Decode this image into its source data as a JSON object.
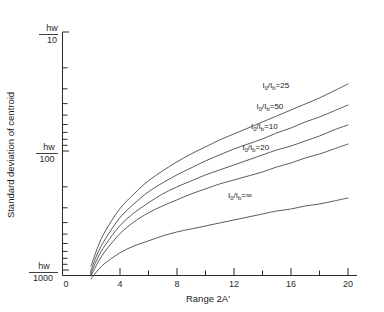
{
  "chart_data": {
    "type": "line",
    "title": "",
    "xlabel": "Range 2A'",
    "ylabel": "Standard deviation of centroid",
    "xlim": [
      0,
      20
    ],
    "xticks": [
      0,
      4,
      8,
      12,
      16,
      20
    ],
    "xtick_labels": [
      "0",
      "4",
      "8",
      "12",
      "16",
      "20"
    ],
    "xminor_ticks": [
      2,
      6,
      10,
      14,
      18
    ],
    "yscale": "log",
    "ylim_labels": [
      "hw/10",
      "hw/100",
      "hw/1000"
    ],
    "yticks": [
      {
        "label_num": "hw",
        "label_den": "10",
        "value": 0.1
      },
      {
        "label_num": "hw",
        "label_den": "100",
        "value": 0.01
      },
      {
        "label_num": "hw",
        "label_den": "1000",
        "value": 0.001
      }
    ],
    "grid": false,
    "legend_position": "inline-curve-labels",
    "series": [
      {
        "name": "I0/Ib=25",
        "label_text": "I",
        "label_sub1": "0",
        "label_mid": "/I",
        "label_sub2": "b",
        "label_value": "=25",
        "label_x": 14.0,
        "label_y_px": 88,
        "x": [
          2.0,
          2.5,
          3,
          4,
          5,
          6,
          7,
          8,
          9,
          10,
          11,
          12,
          13,
          14,
          15,
          16,
          17,
          18,
          19,
          20
        ],
        "y_px": [
          266,
          246,
          231,
          209,
          194,
          181,
          171,
          162,
          154,
          147,
          140,
          134,
          128,
          122,
          116,
          110,
          104,
          98,
          91,
          84
        ]
      },
      {
        "name": "I0/Ib=50",
        "label_text": "I",
        "label_sub1": "0",
        "label_mid": "/I",
        "label_sub2": "b",
        "label_value": "=50",
        "label_x": 13.6,
        "label_y_px": 109,
        "x": [
          2.0,
          2.5,
          3,
          4,
          5,
          6,
          7,
          8,
          9,
          10,
          11,
          12,
          13,
          14,
          15,
          16,
          17,
          18,
          19,
          20
        ],
        "y_px": [
          270,
          252,
          239,
          218,
          204,
          192,
          183,
          175,
          168,
          161,
          155,
          149,
          144,
          139,
          133,
          128,
          122,
          117,
          111,
          105
        ]
      },
      {
        "name": "I0/Ib=10",
        "label_text": "I",
        "label_sub1": "0",
        "label_mid": "/I",
        "label_sub2": "b",
        "label_value": "=10",
        "label_x": 13.2,
        "label_y_px": 129,
        "x": [
          2.0,
          2.5,
          3,
          4,
          5,
          6,
          7,
          8,
          9,
          10,
          11,
          12,
          13,
          14,
          15,
          16,
          17,
          18,
          19,
          20
        ],
        "y_px": [
          273,
          257,
          245,
          226,
          213,
          203,
          194,
          187,
          181,
          175,
          170,
          165,
          160,
          155,
          150,
          146,
          141,
          136,
          130,
          125
        ]
      },
      {
        "name": "I0/Ib=20",
        "label_text": "I",
        "label_sub1": "0",
        "label_mid": "/I",
        "label_sub2": "b",
        "label_value": "=20",
        "label_x": 12.6,
        "label_y_px": 150,
        "x": [
          2.0,
          2.5,
          3,
          4,
          5,
          6,
          7,
          8,
          9,
          10,
          11,
          12,
          13,
          14,
          15,
          16,
          17,
          18,
          19,
          20
        ],
        "y_px": [
          276,
          262,
          251,
          234,
          222,
          213,
          206,
          200,
          194,
          189,
          184,
          180,
          176,
          172,
          167,
          163,
          158,
          154,
          149,
          144
        ]
      },
      {
        "name": "I0/Ib=∞",
        "label_text": "I",
        "label_sub1": "0",
        "label_mid": "/I",
        "label_sub2": "b",
        "label_value": "=∞",
        "label_x": 11.6,
        "label_y_px": 198,
        "x": [
          2.0,
          2.5,
          3,
          4,
          5,
          6,
          7,
          8,
          9,
          10,
          11,
          12,
          13,
          14,
          15,
          16,
          17,
          18,
          19,
          20
        ],
        "y_px": [
          279,
          270,
          263,
          253,
          246,
          241,
          236,
          232,
          229,
          226,
          223,
          220,
          217,
          214,
          211,
          209,
          206,
          204,
          201,
          198
        ]
      }
    ]
  },
  "axes": {
    "y_title": "Standard deviation of centroid",
    "x_title": "Range 2A'",
    "y_labels": [
      {
        "num": "hw",
        "den": "10",
        "y_px": 36
      },
      {
        "num": "hw",
        "den": "100",
        "y_px": 155
      },
      {
        "num": "hw",
        "den": "1000",
        "y_px": 275
      }
    ],
    "x_labels": [
      {
        "text": "0",
        "x_px": 66
      },
      {
        "text": "4",
        "x_px": 121
      },
      {
        "text": "8",
        "x_px": 177
      },
      {
        "text": "12",
        "x_px": 232
      },
      {
        "text": "16",
        "x_px": 288
      },
      {
        "text": "20",
        "x_px": 343
      }
    ]
  }
}
